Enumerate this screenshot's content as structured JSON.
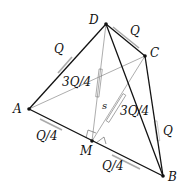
{
  "diagram": {
    "type": "tetrahedron-force-diagram",
    "points": {
      "A": {
        "label": "A",
        "x": 29,
        "y": 109
      },
      "B": {
        "label": "B",
        "x": 163,
        "y": 176
      },
      "C": {
        "label": "C",
        "x": 145,
        "y": 56
      },
      "D": {
        "label": "D",
        "x": 106,
        "y": 24
      },
      "M": {
        "label": "M",
        "x": 92,
        "y": 141
      }
    },
    "edge_labels": {
      "AD": "Q",
      "DC": "Q",
      "CB": "Q",
      "AM": "Q/4",
      "MB": "Q/4",
      "DM": "3Q/4",
      "CM": "3Q/4",
      "s": "s"
    },
    "colors": {
      "heavy_edge": "#111111",
      "light_edge": "#777777",
      "spring": "#888888",
      "point": "#111111"
    }
  }
}
